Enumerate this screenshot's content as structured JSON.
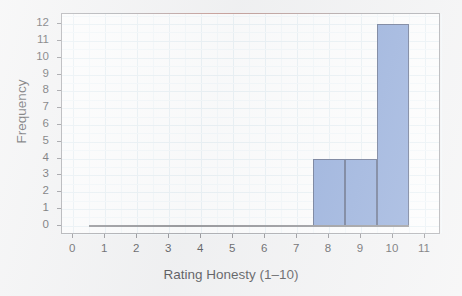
{
  "chart_data": {
    "type": "bar",
    "title": "",
    "subtitle": "",
    "xlabel": "Rating Honesty (1–10)",
    "ylabel": "Frequency",
    "xlim": [
      -0.35,
      11.5
    ],
    "ylim": [
      -0.55,
      12.6
    ],
    "xticks": [
      0,
      1,
      2,
      3,
      4,
      5,
      6,
      7,
      8,
      9,
      10,
      11
    ],
    "xtick_labels": [
      "0",
      "1",
      "2",
      "3",
      "4",
      "5",
      "6",
      "7",
      "8",
      "9",
      "10",
      "11"
    ],
    "yticks": [
      0,
      1,
      2,
      3,
      4,
      5,
      6,
      7,
      8,
      9,
      10,
      11,
      12
    ],
    "ytick_labels": [
      "0",
      "1",
      "2",
      "3",
      "4",
      "5",
      "6",
      "7",
      "8",
      "9",
      "10",
      "11",
      "12"
    ],
    "grid": true,
    "legend": false,
    "bin_width": 1,
    "bins": [
      {
        "left": 7.5,
        "right": 8.5,
        "center": 8,
        "value": 4
      },
      {
        "left": 8.5,
        "right": 9.5,
        "center": 9,
        "value": 4
      },
      {
        "left": 9.5,
        "right": 10.5,
        "center": 10,
        "value": 12
      }
    ],
    "categories": [
      "8",
      "9",
      "10"
    ],
    "values": [
      4,
      4,
      12
    ],
    "baseline": {
      "from": 0.5,
      "to": 10.5,
      "y": 0
    },
    "colors": {
      "bar_fill": "#6E8FCE",
      "bar_edge": "#2F3F68",
      "grid_major": "#E3EDF2",
      "grid_minor": "#F0F6F9",
      "axis": "#8B8B90",
      "baseline": "#6D6D72",
      "text": "#151518",
      "page_background": "#EFEFF0",
      "plot_background": "#FDFDFD"
    }
  }
}
